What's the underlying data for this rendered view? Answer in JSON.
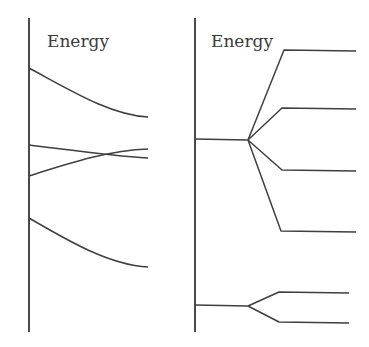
{
  "left_panel": {
    "axis_label": "Energy",
    "axis": {
      "x": 29,
      "y1": 18,
      "y2": 332
    },
    "label_pos": {
      "x": 47,
      "y": 47
    },
    "curves": [
      {
        "name": "upper-curve",
        "d": "M29,68 C70,90 110,115 148,117"
      },
      {
        "name": "middle-falling-curve",
        "d": "M29,145 C70,150 110,156 148,158"
      },
      {
        "name": "middle-rising-curve",
        "d": "M29,176 C70,163 110,150 148,149"
      },
      {
        "name": "lower-curve",
        "d": "M29,218 C70,242 110,265 148,267"
      }
    ]
  },
  "right_panel": {
    "axis_label": "Energy",
    "axis": {
      "x": 195,
      "y1": 18,
      "y2": 332
    },
    "label_pos": {
      "x": 211,
      "y": 47
    },
    "levels": [
      {
        "name": "upper-level-split",
        "d": "M195,139 L248,140 L284,50 L356,51 M248,140 L282,108 L356,109 M248,140 L282,170 L356,171 M248,140 L281,231 L356,232"
      },
      {
        "name": "lower-level-split",
        "d": "M195,305 L248,306 L279,292 L349,293 M248,306 L279,322 L349,323"
      }
    ]
  }
}
